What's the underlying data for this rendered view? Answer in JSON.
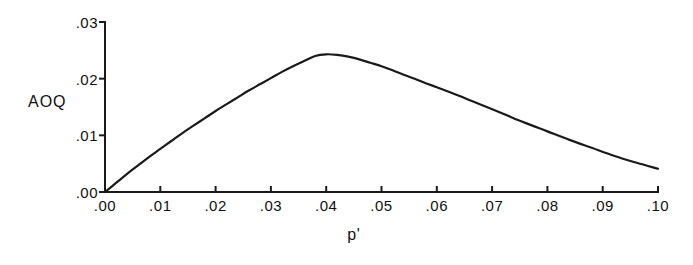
{
  "chart_data": {
    "type": "line",
    "title": "",
    "subtitle": "",
    "xlabel": "p'",
    "ylabel": "AOQ",
    "xlim": [
      0.0,
      0.1
    ],
    "ylim": [
      0.0,
      0.03
    ],
    "grid": false,
    "legend": "none",
    "x_tick_labels": [
      ".00",
      ".01",
      ".02",
      ".03",
      ".04",
      ".05",
      ".06",
      ".07",
      ".08",
      ".09",
      ".10"
    ],
    "x_tick_values": [
      0.0,
      0.01,
      0.02,
      0.03,
      0.04,
      0.05,
      0.06,
      0.07,
      0.08,
      0.09,
      0.1
    ],
    "y_tick_labels": [
      ".00",
      ".01",
      ".02",
      ".03"
    ],
    "y_tick_values": [
      0.0,
      0.01,
      0.02,
      0.03
    ],
    "series": [
      {
        "name": "AOQ",
        "color": "#1a1a1a",
        "x": [
          0.0,
          0.002,
          0.004,
          0.006,
          0.008,
          0.01,
          0.012,
          0.014,
          0.016,
          0.018,
          0.02,
          0.022,
          0.024,
          0.026,
          0.028,
          0.03,
          0.032,
          0.034,
          0.036,
          0.038,
          0.04,
          0.042,
          0.044,
          0.046,
          0.048,
          0.05,
          0.052,
          0.054,
          0.056,
          0.058,
          0.06,
          0.064,
          0.068,
          0.072,
          0.076,
          0.08,
          0.084,
          0.088,
          0.092,
          0.096,
          0.1
        ],
        "y": [
          0.0,
          0.0016,
          0.0032,
          0.0047,
          0.0062,
          0.0076,
          0.009,
          0.0104,
          0.0117,
          0.013,
          0.0143,
          0.0155,
          0.0167,
          0.0179,
          0.019,
          0.0201,
          0.0212,
          0.0222,
          0.0231,
          0.024,
          0.0243,
          0.0242,
          0.0239,
          0.0234,
          0.0228,
          0.0222,
          0.0215,
          0.0207,
          0.02,
          0.0192,
          0.0185,
          0.017,
          0.0154,
          0.0138,
          0.0122,
          0.0107,
          0.0092,
          0.0078,
          0.0064,
          0.0052,
          0.0041
        ]
      }
    ],
    "peak": {
      "x": 0.038,
      "y": 0.0244
    }
  },
  "axes": {
    "y_title": "AOQ",
    "x_title": "p'"
  }
}
